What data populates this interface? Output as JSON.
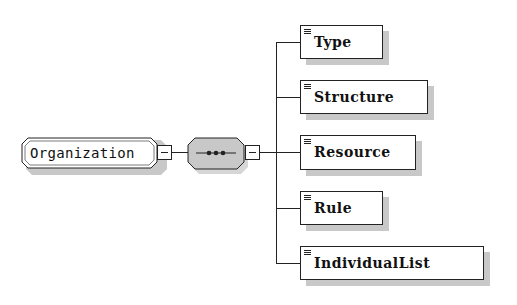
{
  "root": {
    "label": "Organization",
    "type": "element",
    "expanded": true
  },
  "compositor": {
    "type": "sequence",
    "symbol": "•••",
    "expanded": true,
    "fill": "#c8c8c8"
  },
  "children": [
    {
      "label": "Type"
    },
    {
      "label": "Structure"
    },
    {
      "label": "Resource"
    },
    {
      "label": "Rule"
    },
    {
      "label": "IndividualList"
    }
  ]
}
